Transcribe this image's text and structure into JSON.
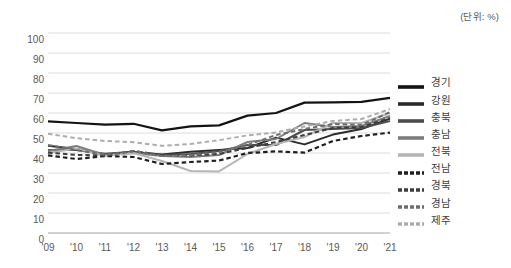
{
  "unit_note": "(단위: %)",
  "legend": {
    "position": "right",
    "items": [
      {
        "label": "경기",
        "color": "#141414",
        "style": "solid",
        "width": 2.2
      },
      {
        "label": "강원",
        "color": "#2b2b2b",
        "style": "solid",
        "width": 2.0
      },
      {
        "label": "충북",
        "color": "#4d4d4d",
        "style": "solid",
        "width": 2.0
      },
      {
        "label": "충남",
        "color": "#7d7d7d",
        "style": "solid",
        "width": 2.0
      },
      {
        "label": "전북",
        "color": "#b5b5b5",
        "style": "solid",
        "width": 2.0
      },
      {
        "label": "전남",
        "color": "#1f1f1f",
        "style": "dashed",
        "width": 2.2
      },
      {
        "label": "경북",
        "color": "#3d3d3d",
        "style": "dashed",
        "width": 2.0
      },
      {
        "label": "경남",
        "color": "#6e6e6e",
        "style": "dashed",
        "width": 2.0
      },
      {
        "label": "제주",
        "color": "#adadad",
        "style": "dashed",
        "width": 2.0
      }
    ]
  },
  "chart_data": {
    "type": "line",
    "title": "",
    "xlabel": "",
    "ylabel": "",
    "unit": "%",
    "grid": true,
    "legend_position": "right",
    "ylim": [
      0,
      100
    ],
    "yticks": [
      0,
      10,
      20,
      30,
      40,
      50,
      60,
      70,
      80,
      90,
      100
    ],
    "categories": [
      "'09",
      "'10",
      "'11",
      "'12",
      "'13",
      "'14",
      "'15",
      "'16",
      "'17",
      "'18",
      "'19",
      "'20",
      "'21"
    ],
    "x": [
      2009,
      2010,
      2011,
      2012,
      2013,
      2014,
      2015,
      2016,
      2017,
      2018,
      2019,
      2020,
      2021
    ],
    "series": [
      {
        "name": "경기",
        "values": [
          55.8,
          55.0,
          54.2,
          54.6,
          51.3,
          53.3,
          53.8,
          58.7,
          60.0,
          65.2,
          65.3,
          65.6,
          67.6
        ]
      },
      {
        "name": "강원",
        "values": [
          43.6,
          42.0,
          39.3,
          40.5,
          39.3,
          40.6,
          41.5,
          42.5,
          47.7,
          44.3,
          49.2,
          52.0,
          57.2
        ]
      },
      {
        "name": "충북",
        "values": [
          41.5,
          41.5,
          39.6,
          40.6,
          39.0,
          39.5,
          41.0,
          44.0,
          44.0,
          51.5,
          52.0,
          52.5,
          56.0
        ]
      },
      {
        "name": "충남",
        "values": [
          41.0,
          43.5,
          39.0,
          40.0,
          38.5,
          38.0,
          39.0,
          45.5,
          47.0,
          55.0,
          53.0,
          53.5,
          58.5
        ]
      },
      {
        "name": "전북",
        "values": [
          40.0,
          42.2,
          38.5,
          40.0,
          36.0,
          31.0,
          30.8,
          39.5,
          44.5,
          48.0,
          55.0,
          55.0,
          60.0
        ]
      },
      {
        "name": "전남",
        "values": [
          38.8,
          37.0,
          38.5,
          38.0,
          34.5,
          35.5,
          36.2,
          40.0,
          40.8,
          40.2,
          46.0,
          48.5,
          50.2
        ]
      },
      {
        "name": "경북",
        "values": [
          40.2,
          39.0,
          38.8,
          41.0,
          39.0,
          38.8,
          39.5,
          42.5,
          45.5,
          49.0,
          52.5,
          53.0,
          57.5
        ]
      },
      {
        "name": "경남",
        "values": [
          44.0,
          41.5,
          39.0,
          41.0,
          38.5,
          39.0,
          40.5,
          44.0,
          49.0,
          52.0,
          54.5,
          54.0,
          60.5
        ]
      },
      {
        "name": "제주",
        "values": [
          49.6,
          47.4,
          46.0,
          45.4,
          43.6,
          44.5,
          46.4,
          48.8,
          50.3,
          53.3,
          56.0,
          57.0,
          62.0
        ]
      }
    ]
  }
}
